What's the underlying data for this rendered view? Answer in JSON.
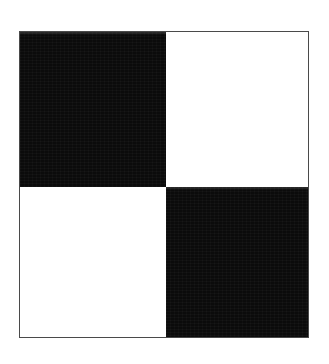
{
  "figure": {
    "caption": "",
    "canvas": {
      "width": 329,
      "height": 364,
      "background_color": "#ffffff"
    },
    "frame": {
      "border_color": "#4a4a4a",
      "border_width_px": 1,
      "fill_color": "#ffffff",
      "left": 19,
      "top": 31,
      "width": 290,
      "height": 307
    },
    "colors": {
      "black": "#0b0b0b",
      "white": "#ffffff",
      "border": "#4a4a4a",
      "paper": "#ffffff"
    },
    "grid": {
      "rows": 2,
      "columns": 2,
      "split_x_px": 146,
      "split_y_px": 155
    },
    "quadrants": [
      {
        "id": "top-left",
        "name": "quadrant-top-left",
        "fill": "black",
        "row": 1,
        "column": 1,
        "left": 0,
        "top": 0,
        "width": 146,
        "height": 155
      },
      {
        "id": "top-right",
        "name": "quadrant-top-right",
        "fill": "white",
        "row": 1,
        "column": 2,
        "left": 146,
        "top": 0,
        "width": 144,
        "height": 155
      },
      {
        "id": "bottom-left",
        "name": "quadrant-bottom-left",
        "fill": "white",
        "row": 2,
        "column": 1,
        "left": 0,
        "top": 155,
        "width": 146,
        "height": 152
      },
      {
        "id": "bottom-right",
        "name": "quadrant-bottom-right",
        "fill": "black",
        "row": 2,
        "column": 2,
        "left": 146,
        "top": 155,
        "width": 144,
        "height": 152
      }
    ]
  }
}
